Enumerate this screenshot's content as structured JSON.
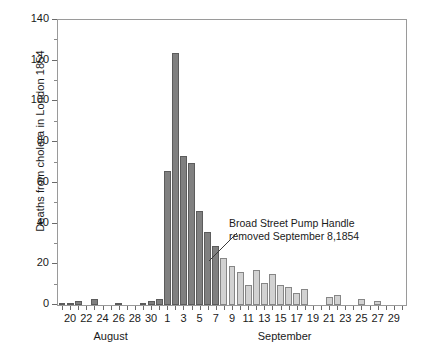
{
  "chart_data": {
    "type": "bar",
    "title": "",
    "subtitle": "",
    "xlabel": "",
    "ylabel": "Deaths from cholera in London 1854",
    "ylim": [
      0,
      140
    ],
    "ytick_values": [
      0,
      20,
      40,
      60,
      80,
      100,
      120,
      140
    ],
    "ytick_labels": [
      "0",
      "20",
      "40",
      "60",
      "80",
      "100",
      "120",
      "140"
    ],
    "yminor_values": [
      10,
      30,
      50,
      70,
      90,
      110,
      130
    ],
    "grid": false,
    "legend": null,
    "month_labels": [
      {
        "label": "August",
        "center_date": "August 25"
      },
      {
        "label": "September",
        "center_date": "September 15"
      }
    ],
    "xtick_labels": [
      "20",
      "22",
      "24",
      "26",
      "28",
      "30",
      "1",
      "3",
      "5",
      "7",
      "9",
      "11",
      "13",
      "15",
      "17",
      "19",
      "21",
      "23",
      "25",
      "27",
      "29"
    ],
    "categories": [
      "August 19",
      "August 20",
      "August 21",
      "August 22",
      "August 23",
      "August 24",
      "August 25",
      "August 26",
      "August 27",
      "August 28",
      "August 29",
      "August 30",
      "August 31",
      "September 1",
      "September 2",
      "September 3",
      "September 4",
      "September 5",
      "September 6",
      "September 7",
      "September 8",
      "September 9",
      "September 10",
      "September 11",
      "September 12",
      "September 13",
      "September 14",
      "September 15",
      "September 16",
      "September 17",
      "September 18",
      "September 19",
      "September 20",
      "September 21",
      "September 22",
      "September 23",
      "September 24",
      "September 25",
      "September 26",
      "September 27",
      "September 28",
      "September 29",
      "September 30"
    ],
    "values": [
      1,
      1,
      2,
      0,
      3,
      0,
      0,
      1,
      0,
      0,
      1,
      2,
      3,
      66,
      124,
      73,
      70,
      46,
      36,
      29,
      23,
      19,
      16,
      10,
      17,
      11,
      15,
      10,
      9,
      6,
      8,
      0,
      0,
      4,
      5,
      0,
      0,
      3,
      0,
      2,
      0,
      0,
      0
    ],
    "series_colors": {
      "before_intervention": "#808080",
      "after_intervention": "#d2d2d2"
    },
    "bar_color_split_index": 20,
    "annotations": [
      {
        "line1": "Broad Street Pump Handle",
        "line2": "removed September 8,1854",
        "points_to": "September 8"
      }
    ]
  }
}
